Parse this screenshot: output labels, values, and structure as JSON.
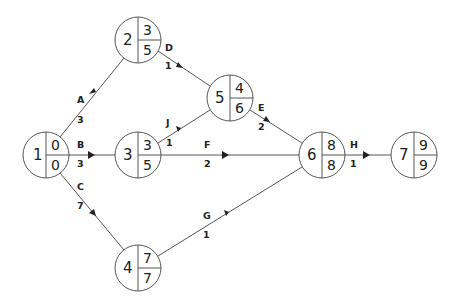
{
  "diagram": {
    "type": "activity-on-arrow network (CPM)",
    "nodes": [
      {
        "id": "1",
        "x": 46,
        "y": 155,
        "early": "0",
        "late": "0"
      },
      {
        "id": "2",
        "x": 138,
        "y": 40,
        "early": "3",
        "late": "5"
      },
      {
        "id": "3",
        "x": 138,
        "y": 155,
        "early": "3",
        "late": "5"
      },
      {
        "id": "4",
        "x": 138,
        "y": 268,
        "early": "7",
        "late": "7"
      },
      {
        "id": "5",
        "x": 230,
        "y": 98,
        "early": "4",
        "late": "6"
      },
      {
        "id": "6",
        "x": 322,
        "y": 155,
        "early": "8",
        "late": "8"
      },
      {
        "id": "7",
        "x": 414,
        "y": 155,
        "early": "9",
        "late": "9"
      }
    ],
    "activities": [
      {
        "name": "A",
        "from": "1",
        "to": "2",
        "duration": "3"
      },
      {
        "name": "B",
        "from": "1",
        "to": "3",
        "duration": "3"
      },
      {
        "name": "C",
        "from": "1",
        "to": "4",
        "duration": "7"
      },
      {
        "name": "D",
        "from": "2",
        "to": "5",
        "duration": "1"
      },
      {
        "name": "J",
        "from": "3",
        "to": "5",
        "duration": "1"
      },
      {
        "name": "F",
        "from": "3",
        "to": "6",
        "duration": "2"
      },
      {
        "name": "E",
        "from": "5",
        "to": "6",
        "duration": "2"
      },
      {
        "name": "G",
        "from": "4",
        "to": "6",
        "duration": "1"
      },
      {
        "name": "H",
        "from": "6",
        "to": "7",
        "duration": "1"
      }
    ]
  }
}
